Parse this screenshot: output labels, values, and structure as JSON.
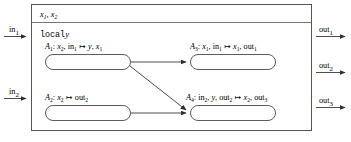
{
  "diagram": {
    "type": "component-block-diagram",
    "outer_frame": {
      "name": "component-boundary"
    },
    "header": {
      "state_variables": "x1, x2",
      "state_variables_parts": [
        {
          "base": "x",
          "sub": "1"
        },
        {
          "base": "x",
          "sub": "2"
        }
      ]
    },
    "local_declaration": {
      "keyword": "local",
      "variable": "y"
    },
    "inputs": [
      {
        "id": "in1",
        "base": "in",
        "sub": "1"
      },
      {
        "id": "in2",
        "base": "in",
        "sub": "2"
      }
    ],
    "outputs": [
      {
        "id": "out1",
        "base": "out",
        "sub": "1"
      },
      {
        "id": "out2",
        "base": "out",
        "sub": "2"
      },
      {
        "id": "out3",
        "base": "out",
        "sub": "3"
      }
    ],
    "actions": [
      {
        "id": "A1",
        "name": "A",
        "sub": "1",
        "signature": "x2, in1 |-> y, x1",
        "reads": [
          {
            "base": "x",
            "sub": "2"
          },
          {
            "base": "in",
            "sub": "1"
          }
        ],
        "writes": [
          {
            "base": "y",
            "sub": ""
          },
          {
            "base": "x",
            "sub": "1"
          }
        ]
      },
      {
        "id": "A3",
        "name": "A",
        "sub": "3",
        "signature": "x1, in1 |-> x1, out1",
        "reads": [
          {
            "base": "x",
            "sub": "1"
          },
          {
            "base": "in",
            "sub": "1"
          }
        ],
        "writes": [
          {
            "base": "x",
            "sub": "1"
          },
          {
            "base": "out",
            "sub": "1"
          }
        ]
      },
      {
        "id": "A2",
        "name": "A",
        "sub": "2",
        "signature": "x2 |-> out2",
        "reads": [
          {
            "base": "x",
            "sub": "2"
          }
        ],
        "writes": [
          {
            "base": "out",
            "sub": "2"
          }
        ]
      },
      {
        "id": "A4",
        "name": "A",
        "sub": "4",
        "signature": "in2, y, out2 |-> x2, out3",
        "reads": [
          {
            "base": "in",
            "sub": "2"
          },
          {
            "base": "y",
            "sub": ""
          },
          {
            "base": "out",
            "sub": "2"
          }
        ],
        "writes": [
          {
            "base": "x",
            "sub": "2"
          },
          {
            "base": "out",
            "sub": "3"
          }
        ]
      }
    ],
    "edges": [
      {
        "from": "A1",
        "to": "A3",
        "style": "horizontal"
      },
      {
        "from": "A1",
        "to": "A4",
        "style": "diagonal"
      },
      {
        "from": "A2",
        "to": "A4",
        "style": "horizontal"
      }
    ],
    "colors": {
      "line": "#3a3a3a",
      "frame": "#4a4a4a",
      "text": "#000000",
      "background": "#ffffff"
    }
  }
}
